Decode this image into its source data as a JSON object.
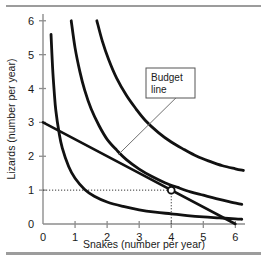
{
  "chart_data": {
    "type": "line",
    "title": "",
    "xlabel": "Snakes (number per year)",
    "ylabel": "Lizards (number per year)",
    "xlim": [
      0,
      6.3
    ],
    "ylim": [
      0,
      6.2
    ],
    "xticks": [
      "0",
      "1",
      "2",
      "3",
      "4",
      "5",
      "6"
    ],
    "yticks": [
      "0",
      "1",
      "2",
      "3",
      "4",
      "5",
      "6"
    ],
    "xtick_values": [
      0,
      1,
      2,
      3,
      4,
      5,
      6
    ],
    "ytick_values": [
      0,
      1,
      2,
      3,
      4,
      5,
      6
    ],
    "grid": false,
    "legend": "none",
    "series": [
      {
        "name": "indifference-curve-1",
        "kind": "indifference-curve",
        "points": [
          [
            0.25,
            5.6
          ],
          [
            0.3,
            4.6
          ],
          [
            0.35,
            3.9
          ],
          [
            0.4,
            3.35
          ],
          [
            0.5,
            2.7
          ],
          [
            0.6,
            2.25
          ],
          [
            0.8,
            1.7
          ],
          [
            1.0,
            1.35
          ],
          [
            1.3,
            1.02
          ],
          [
            1.6,
            0.82
          ],
          [
            2.0,
            0.65
          ],
          [
            2.5,
            0.52
          ],
          [
            3.0,
            0.42
          ],
          [
            3.5,
            0.35
          ],
          [
            4.0,
            0.3
          ],
          [
            4.5,
            0.25
          ],
          [
            5.0,
            0.21
          ],
          [
            5.5,
            0.18
          ],
          [
            6.0,
            0.15
          ],
          [
            6.2,
            0.14
          ]
        ]
      },
      {
        "name": "indifference-curve-2",
        "kind": "indifference-curve",
        "points": [
          [
            0.88,
            6.0
          ],
          [
            1.0,
            5.2
          ],
          [
            1.15,
            4.5
          ],
          [
            1.3,
            3.95
          ],
          [
            1.5,
            3.4
          ],
          [
            1.75,
            2.9
          ],
          [
            2.0,
            2.5
          ],
          [
            2.3,
            2.18
          ],
          [
            2.6,
            1.9
          ],
          [
            3.0,
            1.62
          ],
          [
            3.4,
            1.4
          ],
          [
            3.8,
            1.22
          ],
          [
            4.2,
            1.08
          ],
          [
            4.6,
            0.95
          ],
          [
            5.0,
            0.85
          ],
          [
            5.4,
            0.75
          ],
          [
            5.8,
            0.66
          ],
          [
            6.2,
            0.58
          ]
        ]
      },
      {
        "name": "indifference-curve-3",
        "kind": "indifference-curve",
        "points": [
          [
            1.68,
            6.0
          ],
          [
            1.85,
            5.4
          ],
          [
            2.05,
            4.85
          ],
          [
            2.3,
            4.3
          ],
          [
            2.6,
            3.8
          ],
          [
            2.9,
            3.4
          ],
          [
            3.2,
            3.05
          ],
          [
            3.6,
            2.7
          ],
          [
            4.0,
            2.42
          ],
          [
            4.4,
            2.2
          ],
          [
            4.8,
            2.0
          ],
          [
            5.2,
            1.85
          ],
          [
            5.6,
            1.72
          ],
          [
            6.0,
            1.63
          ],
          [
            6.25,
            1.58
          ]
        ]
      },
      {
        "name": "budget-line",
        "kind": "budget-line",
        "points": [
          [
            0,
            3.0
          ],
          [
            6.0,
            0.0
          ]
        ]
      }
    ],
    "annotations": [
      {
        "name": "budget-line-callout",
        "text_lines": [
          "Budget",
          "line"
        ],
        "box": true,
        "leader_from": [
          4.55,
          4.1
        ],
        "leader_to": [
          2.35,
          2.05
        ]
      }
    ],
    "markers": [
      {
        "name": "tangency-point",
        "x": 4,
        "y": 1,
        "style": "open-circle",
        "guides": "dotted"
      }
    ],
    "colors": {
      "curve": "#111111",
      "budget_line": "#111111",
      "axis": "#8d8d8d",
      "text": "#1a1a1a",
      "rule": "#9c9c9c",
      "guide": "#333333",
      "callout_border": "#555555",
      "leader": "#707070",
      "background": "#ffffff"
    }
  },
  "callout": {
    "line1": "Budget",
    "line2": "line"
  },
  "axes": {
    "x_title": "Snakes (number per year)",
    "y_title": "Lizards (number per year)"
  }
}
